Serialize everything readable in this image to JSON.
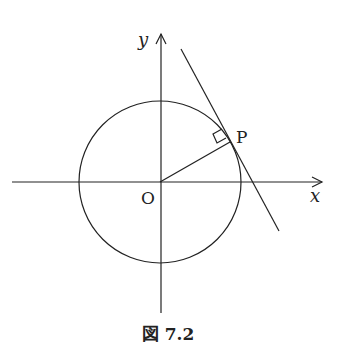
{
  "figure": {
    "caption": "図 7.2",
    "labels": {
      "y_axis": "y",
      "x_axis": "x",
      "origin": "O",
      "point": "P"
    },
    "elements": {
      "circle": {
        "center": "O",
        "description": "circle centered at origin"
      },
      "radius_segment": "OP",
      "tangent_line": "tangent to circle at P",
      "right_angle_marker": "at P between OP and tangent"
    }
  }
}
